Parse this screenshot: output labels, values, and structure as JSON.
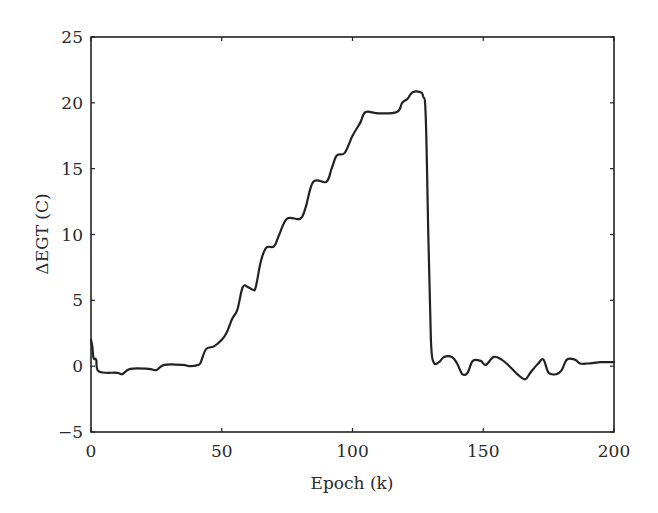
{
  "chart_data": {
    "type": "line",
    "title": "",
    "xlabel": "Epoch (k)",
    "ylabel": "ΔEGT (C)",
    "xlim": [
      0,
      200
    ],
    "ylim": [
      -5,
      25
    ],
    "xticks": [
      0,
      50,
      100,
      150,
      200
    ],
    "yticks": [
      -5,
      0,
      5,
      10,
      15,
      20,
      25
    ],
    "xtick_labels": [
      "0",
      "50",
      "100",
      "150",
      "200"
    ],
    "ytick_labels": [
      "−5",
      "0",
      "5",
      "10",
      "15",
      "20",
      "25"
    ],
    "grid": false,
    "legend": null,
    "series": [
      {
        "name": "ΔEGT",
        "color": "#222222",
        "x": [
          0,
          0.5,
          1,
          2,
          3,
          10,
          12,
          15,
          22,
          25,
          28,
          35,
          38,
          41,
          42,
          44,
          47,
          50,
          52,
          54,
          56,
          58,
          60,
          62,
          63,
          65,
          67,
          70,
          72,
          75,
          80,
          82,
          85,
          90,
          92,
          94,
          97,
          100,
          103,
          105,
          110,
          117,
          119,
          121,
          123,
          126,
          127,
          128,
          129,
          130,
          131,
          133,
          135,
          138,
          140,
          142,
          144,
          146,
          149,
          151,
          154,
          157,
          160,
          163,
          166,
          168,
          171,
          173,
          175,
          178,
          180,
          182,
          185,
          187,
          190,
          195,
          200
        ],
        "values": [
          2.0,
          1.5,
          0.6,
          0.5,
          -0.4,
          -0.5,
          -0.6,
          -0.2,
          -0.2,
          -0.3,
          0.1,
          0.1,
          0.0,
          0.1,
          0.3,
          1.3,
          1.5,
          2.0,
          2.6,
          3.6,
          4.3,
          6.0,
          6.0,
          5.8,
          6.0,
          8.0,
          9.0,
          9.1,
          10.0,
          11.2,
          11.2,
          12.0,
          14.0,
          14.0,
          15.0,
          16.0,
          16.2,
          17.5,
          18.5,
          19.3,
          19.2,
          19.3,
          20.0,
          20.3,
          20.8,
          20.8,
          20.5,
          19.0,
          10.0,
          2.0,
          0.3,
          0.3,
          0.7,
          0.7,
          0.2,
          -0.6,
          -0.5,
          0.4,
          0.4,
          0.1,
          0.7,
          0.5,
          0.0,
          -0.6,
          -1.0,
          -0.5,
          0.2,
          0.5,
          -0.5,
          -0.6,
          -0.3,
          0.5,
          0.5,
          0.2,
          0.2,
          0.3,
          0.3
        ]
      }
    ]
  }
}
